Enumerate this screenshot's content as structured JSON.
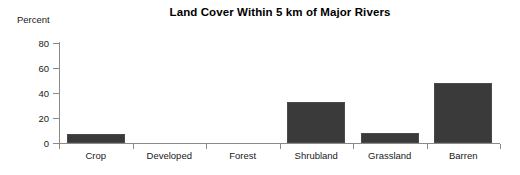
{
  "chart_data": {
    "type": "bar",
    "title": "Land Cover Within 5 km of Major Rivers",
    "xlabel": "",
    "ylabel": "Percent",
    "categories": [
      "Crop",
      "Developed",
      "Forest",
      "Shrubland",
      "Grassland",
      "Barren"
    ],
    "values": [
      7,
      0,
      0,
      33,
      8,
      48
    ],
    "ylim": [
      0,
      80
    ],
    "yticks": [
      0,
      20,
      40,
      60,
      80
    ],
    "ytick_labels": [
      "0",
      "20",
      "40",
      "60",
      "80"
    ],
    "grid": false,
    "legend": false,
    "bar_color": "#3a3a3a",
    "axis_color": "#8a8a8a"
  }
}
